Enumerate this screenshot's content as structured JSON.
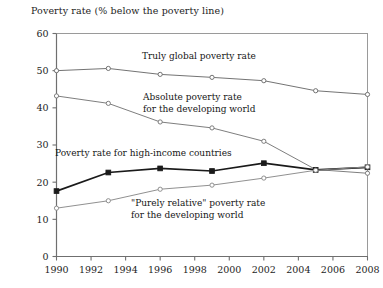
{
  "chart_data": {
    "type": "line",
    "title": "Poverty rate (% below the poverty line)",
    "xlabel": "",
    "ylabel": "",
    "xlim": [
      1990,
      2008
    ],
    "ylim": [
      0,
      60
    ],
    "yticks": [
      0,
      10,
      20,
      30,
      40,
      50,
      60
    ],
    "xticks": [
      1990,
      1992,
      1994,
      1996,
      1998,
      2000,
      2002,
      2004,
      2006,
      2008
    ],
    "ytick_labels": [
      "0",
      "10",
      "20",
      "30",
      "40",
      "50",
      "60"
    ],
    "xtick_labels": [
      "1990",
      "1992",
      "1994",
      "1996",
      "1998",
      "2000",
      "2002",
      "2004",
      "2006",
      "2008"
    ],
    "grid": false,
    "legend": "inline-annotations",
    "x": [
      1990,
      1993,
      1996,
      1999,
      2002,
      2005,
      2008
    ],
    "series": [
      {
        "name": "Truly global poverty rate",
        "marker": "open-circle",
        "color": "#6b6b6b",
        "values": [
          50.0,
          50.6,
          49.0,
          48.2,
          47.3,
          44.6,
          43.6
        ]
      },
      {
        "name": "Absolute poverty rate for the developing world",
        "marker": "open-circle",
        "color": "#777777",
        "values": [
          43.2,
          41.2,
          36.2,
          34.6,
          31.0,
          23.4,
          22.4
        ]
      },
      {
        "name": "Poverty rate for high-income countries",
        "marker": "filled-square",
        "color": "#1a1a1a",
        "values": [
          17.6,
          22.6,
          23.7,
          23.0,
          25.1,
          23.3,
          24.0
        ]
      },
      {
        "name": "\"Purely relative\" poverty rate for the developing world",
        "marker": "open-circle",
        "color": "#8a8a8a",
        "values": [
          13.0,
          15.0,
          18.1,
          19.2,
          21.1,
          23.2,
          24.1
        ]
      }
    ],
    "annotations": [
      {
        "id": "truly-global",
        "lines": [
          "Truly global poverty rate"
        ],
        "x": 142,
        "y": 59,
        "anchor": "start"
      },
      {
        "id": "absolute-developing",
        "lines": [
          "Absolute poverty rate",
          "for the developing world"
        ],
        "x": 143,
        "y": 100,
        "anchor": "start"
      },
      {
        "id": "high-income",
        "lines": [
          "Poverty rate for high-income countries"
        ],
        "x": 55,
        "y": 156,
        "anchor": "start"
      },
      {
        "id": "purely-relative",
        "lines": [
          "\"Purely relative\" poverty rate",
          "for the developing world"
        ],
        "x": 131,
        "y": 206,
        "anchor": "start"
      }
    ]
  }
}
